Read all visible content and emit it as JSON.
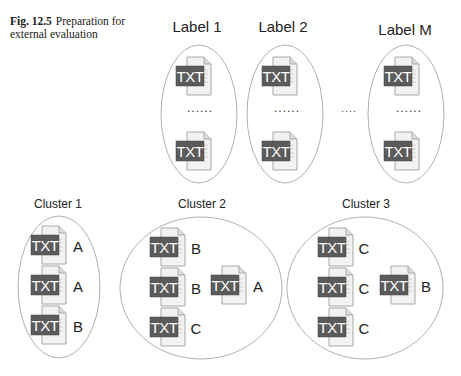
{
  "caption": {
    "figure_number": "Fig. 12.5",
    "text": "Preparation for external evaluation"
  },
  "colors": {
    "ellipse_stroke": "#9a9a9a",
    "txt_box": "#5b5b5b",
    "txt_text": "#ffffff",
    "page_fill": "#f2f2f2",
    "page_stroke": "#a8a8a8",
    "label_text": "#222222"
  },
  "icon_label": "TXT",
  "top_groups": [
    {
      "label": "Label 1",
      "label_x": 197,
      "label_y": 32,
      "cx": 199,
      "cy": 114,
      "rx": 38,
      "ry": 69,
      "icons": [
        {
          "x": 176,
          "y": 57
        },
        {
          "x": 176,
          "y": 132
        }
      ],
      "ellipsis": "......",
      "ellipsis_x": 200,
      "ellipsis_y": 112
    },
    {
      "label": "Label 2",
      "label_x": 283,
      "label_y": 32,
      "cx": 285,
      "cy": 114,
      "rx": 38,
      "ry": 69,
      "icons": [
        {
          "x": 262,
          "y": 57
        },
        {
          "x": 262,
          "y": 132
        }
      ],
      "ellipsis": "......",
      "ellipsis_x": 287,
      "ellipsis_y": 112
    },
    {
      "label": "Label M",
      "label_x": 405,
      "label_y": 35,
      "cx": 406,
      "cy": 114,
      "rx": 38,
      "ry": 69,
      "icons": [
        {
          "x": 384,
          "y": 57
        },
        {
          "x": 384,
          "y": 132
        }
      ],
      "ellipsis": "......",
      "ellipsis_x": 409,
      "ellipsis_y": 112
    }
  ],
  "between_ellipsis": {
    "text": "....",
    "x": 349,
    "y": 112
  },
  "clusters": [
    {
      "label": "Cluster 1",
      "label_x": 58,
      "label_y": 208,
      "cx": 59,
      "cy": 287,
      "rx": 41,
      "ry": 71,
      "docs": [
        {
          "x": 31,
          "y": 226,
          "tag": "A",
          "tag_x": 78,
          "tag_y": 252
        },
        {
          "x": 31,
          "y": 266,
          "tag": "A",
          "tag_x": 78,
          "tag_y": 292
        },
        {
          "x": 31,
          "y": 306,
          "tag": "B",
          "tag_x": 78,
          "tag_y": 332
        }
      ]
    },
    {
      "label": "Cluster 2",
      "label_x": 202,
      "label_y": 208,
      "cx": 201,
      "cy": 288,
      "rx": 81,
      "ry": 71,
      "docs": [
        {
          "x": 150,
          "y": 228,
          "tag": "B",
          "tag_x": 196,
          "tag_y": 254
        },
        {
          "x": 150,
          "y": 268,
          "tag": "B",
          "tag_x": 196,
          "tag_y": 294
        },
        {
          "x": 150,
          "y": 308,
          "tag": "C",
          "tag_x": 196,
          "tag_y": 334
        },
        {
          "x": 211,
          "y": 266,
          "tag": "A",
          "tag_x": 258,
          "tag_y": 292
        }
      ]
    },
    {
      "label": "Cluster 3",
      "label_x": 366,
      "label_y": 208,
      "cx": 365,
      "cy": 288,
      "rx": 78,
      "ry": 71,
      "docs": [
        {
          "x": 318,
          "y": 228,
          "tag": "C",
          "tag_x": 364,
          "tag_y": 254
        },
        {
          "x": 318,
          "y": 268,
          "tag": "C",
          "tag_x": 364,
          "tag_y": 294
        },
        {
          "x": 318,
          "y": 308,
          "tag": "C",
          "tag_x": 364,
          "tag_y": 334
        },
        {
          "x": 380,
          "y": 266,
          "tag": "B",
          "tag_x": 426,
          "tag_y": 292
        }
      ]
    }
  ]
}
